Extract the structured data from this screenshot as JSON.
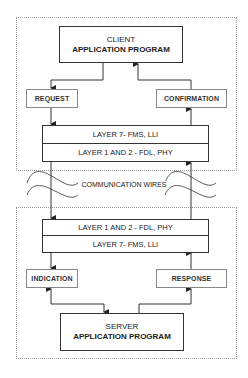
{
  "client": {
    "title": "CLIENT",
    "subtitle": "APPLICATION PROGRAM"
  },
  "client_side": {
    "request": "REQUEST",
    "confirmation": "CONFIRMATION",
    "layer_top": "LAYER 7- FMS, LLI",
    "layer_bottom": "LAYER 1 AND 2 - FDL, PHY"
  },
  "medium": {
    "label": "COMMUNICATION WIRES"
  },
  "server_side": {
    "layer_top": "LAYER 1 AND 2 - FDL, PHY",
    "layer_bottom": "LAYER 7- FMS, LLI",
    "indication": "INDICATION",
    "response": "RESPONSE"
  },
  "server": {
    "title": "SERVER",
    "subtitle": "APPLICATION PROGRAM"
  },
  "colors": {
    "line": "#333333",
    "dotted_border": "#9a9a9a"
  }
}
